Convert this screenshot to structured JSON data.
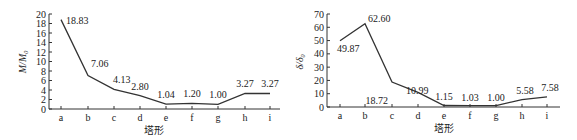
{
  "chart_data": [
    {
      "type": "line",
      "title": "",
      "xlabel": "塔形",
      "ylabel": "M/M_0",
      "categories": [
        "a",
        "b",
        "c",
        "d",
        "e",
        "f",
        "g",
        "h",
        "i"
      ],
      "values": [
        18.83,
        7.06,
        4.13,
        2.8,
        1.04,
        1.2,
        1.0,
        3.27,
        3.27
      ],
      "data_labels": [
        "18.83",
        "7.06",
        "4.13",
        "2.80",
        "1.04",
        "1.20",
        "1.00",
        "3.27",
        "3.27"
      ],
      "ylim": [
        0,
        20
      ],
      "yticks": [
        0,
        2,
        4,
        6,
        8,
        10,
        12,
        14,
        16,
        18,
        20
      ],
      "grid": false,
      "legend": null
    },
    {
      "type": "line",
      "title": "",
      "xlabel": "塔形",
      "ylabel": "δ/δ_0",
      "categories": [
        "a",
        "b",
        "c",
        "d",
        "e",
        "f",
        "g",
        "h",
        "i"
      ],
      "values": [
        49.87,
        62.6,
        18.72,
        10.99,
        1.15,
        1.03,
        1.0,
        5.58,
        7.58
      ],
      "data_labels": [
        "49.87",
        "62.60",
        "18.72",
        "10.99",
        "1.15",
        "1.03",
        "1.00",
        "5.58",
        "7.58"
      ],
      "ylim": [
        0,
        70
      ],
      "yticks": [
        0,
        10,
        20,
        30,
        40,
        50,
        60,
        70
      ],
      "grid": false,
      "legend": null
    }
  ],
  "charts": {
    "left": {
      "ylabel_main": "M/M",
      "ylabel_sub": "0",
      "xlabel": "塔形",
      "categories": [
        "a",
        "b",
        "c",
        "d",
        "e",
        "f",
        "g",
        "h",
        "i"
      ],
      "yticks": [
        "0",
        "2",
        "4",
        "6",
        "8",
        "10",
        "12",
        "14",
        "16",
        "18",
        "20"
      ],
      "labels": [
        "18.83",
        "7.06",
        "4.13",
        "2.80",
        "1.04",
        "1.20",
        "1.00",
        "3.27",
        "3.27"
      ]
    },
    "right": {
      "ylabel_main": "δ/δ",
      "ylabel_sub": "0",
      "xlabel": "塔形",
      "categories": [
        "a",
        "b",
        "c",
        "d",
        "e",
        "f",
        "g",
        "h",
        "i"
      ],
      "yticks": [
        "0",
        "10",
        "20",
        "30",
        "40",
        "50",
        "60",
        "70"
      ],
      "labels": [
        "49.87",
        "62.60",
        "18.72",
        "10.99",
        "1.15",
        "1.03",
        "1.00",
        "5.58",
        "7.58"
      ]
    }
  }
}
